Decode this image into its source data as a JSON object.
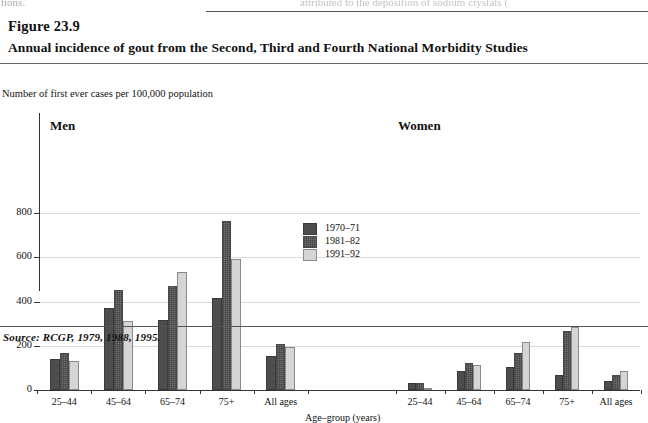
{
  "page": {
    "cutoff_left": "tions.",
    "cutoff_right": "attributed to the deposition of sodium crystals (",
    "figure_number": "Figure 23.9",
    "figure_title": "Annual incidence of gout from the Second, Third and Fourth National Morbidity Studies",
    "source": "Source: RCGP, 1979, 1988, 1995."
  },
  "chart_data": {
    "type": "bar",
    "title": "Annual incidence of gout from the Second, Third and Fourth National Morbidity Studies",
    "ylabel": "Number of first ever cases per 100,000 population",
    "xlabel": "Age–group (years)",
    "ylim": [
      0,
      800
    ],
    "yticks": [
      0,
      200,
      400,
      600,
      800
    ],
    "ytick_labels": [
      "0",
      "200",
      "400",
      "600",
      "800"
    ],
    "grid": true,
    "legend_position": "center",
    "categories": [
      "25–44",
      "45–64",
      "65–74",
      "75+",
      "All ages"
    ],
    "legend": [
      "1970–71",
      "1981–82",
      "1991–92"
    ],
    "colors": [
      "#4d4d4d",
      "#6f6f6f",
      "#d5d5d5"
    ],
    "panels": [
      {
        "label": "Men",
        "series": [
          {
            "name": "1970–71",
            "values": [
              140,
              372,
              315,
              415,
              155
            ]
          },
          {
            "name": "1981–82",
            "values": [
              168,
              450,
              470,
              765,
              210
            ]
          },
          {
            "name": "1991–92",
            "values": [
              130,
              312,
              535,
              590,
              195
            ]
          }
        ]
      },
      {
        "label": "Women",
        "series": [
          {
            "name": "1970–71",
            "values": [
              30,
              85,
              105,
              70,
              40
            ]
          },
          {
            "name": "1981–82",
            "values": [
              30,
              120,
              165,
              265,
              70
            ]
          },
          {
            "name": "1991–92",
            "values": [
              10,
              115,
              215,
              285,
              85
            ]
          }
        ]
      }
    ]
  }
}
